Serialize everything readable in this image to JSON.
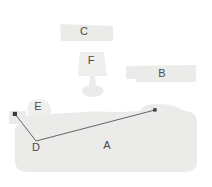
{
  "figure": {
    "background_color": "#ffffff",
    "canvas": {
      "width": 212,
      "height": 187
    },
    "shape_fill_light": "#ebebe9",
    "shape_fill_lighter": "#efefee",
    "label_color": "#4a4a4a",
    "annotation_line_color": "#555555",
    "marker_color": "#3a3a3a"
  },
  "labels": {
    "a": "A",
    "b": "B",
    "c": "C",
    "d": "D",
    "e": "E",
    "f": "F"
  },
  "regions": [
    {
      "id": "a",
      "label": "A",
      "shape": "large-rounded-blob",
      "label_x": 107,
      "label_y": 146
    },
    {
      "id": "b",
      "label": "B",
      "shape": "horizontal-bar",
      "label_x": 162,
      "label_y": 74
    },
    {
      "id": "c",
      "label": "C",
      "shape": "horizontal-bar",
      "label_x": 84,
      "label_y": 32
    },
    {
      "id": "d",
      "label": "D",
      "shape": "vertex-label",
      "label_x": 36,
      "label_y": 148
    },
    {
      "id": "e",
      "label": "E",
      "shape": "small-blob",
      "label_x": 38,
      "label_y": 107
    },
    {
      "id": "f",
      "label": "F",
      "shape": "lamp",
      "label_x": 91,
      "label_y": 61
    }
  ],
  "annotation": {
    "name": "measurement-polyline",
    "points": "15,114 36,141 155,110",
    "stroke_width": 0.9,
    "markers": [
      {
        "name": "start-marker",
        "x": 15,
        "y": 114
      },
      {
        "name": "end-marker",
        "x": 155,
        "y": 110
      }
    ]
  }
}
